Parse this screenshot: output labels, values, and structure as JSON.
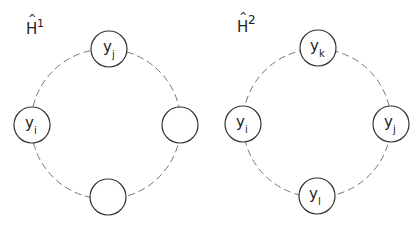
{
  "diagrams": [
    {
      "title": "H",
      "hat": "^",
      "superscript": "1",
      "cx": 106,
      "cy": 124,
      "ring_r": 75,
      "nodes": [
        {
          "pos": "top",
          "x": 109,
          "y": 49,
          "base": "y",
          "sub": "j"
        },
        {
          "pos": "left",
          "x": 32,
          "y": 125,
          "base": "y",
          "sub": "i"
        },
        {
          "pos": "right",
          "x": 180,
          "y": 125,
          "base": "",
          "sub": ""
        },
        {
          "pos": "bottom",
          "x": 108,
          "y": 197,
          "base": "",
          "sub": ""
        }
      ]
    },
    {
      "title": "H",
      "hat": "^",
      "superscript": "2",
      "cx": 317,
      "cy": 123,
      "ring_r": 74,
      "nodes": [
        {
          "pos": "top",
          "x": 318,
          "y": 48,
          "base": "y",
          "sub": "k"
        },
        {
          "pos": "left",
          "x": 243,
          "y": 124,
          "base": "y",
          "sub": "i"
        },
        {
          "pos": "right",
          "x": 391,
          "y": 124,
          "base": "y",
          "sub": "j"
        },
        {
          "pos": "bottom",
          "x": 317,
          "y": 196,
          "base": "y",
          "sub": "l"
        }
      ]
    }
  ],
  "node_radius": 18
}
